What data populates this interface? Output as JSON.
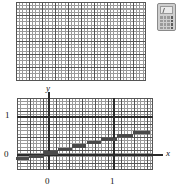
{
  "figure": {
    "top_panel": {
      "name": "blank-grid",
      "cols": 10,
      "rows": 6,
      "minor_per_major": 4
    },
    "calculator_icon": {
      "label": "calculator-icon",
      "rows": 4,
      "cols": 4
    },
    "plot": {
      "axis_x_name": "x",
      "axis_y_name": "y",
      "x_ticks": [
        "0",
        "1"
      ],
      "y_ticks": [
        "0",
        "1"
      ]
    }
  },
  "chart_data": {
    "type": "line",
    "title": "",
    "xlabel": "x",
    "ylabel": "y",
    "xlim": [
      -0.5,
      1.75
    ],
    "ylim": [
      -0.45,
      1.45
    ],
    "x_tick_values": [
      0,
      1
    ],
    "x_tick_labels": [
      "0",
      "1"
    ],
    "y_tick_values": [
      0,
      1
    ],
    "y_tick_labels": [
      "0",
      "1"
    ],
    "grid": true,
    "legend": "none",
    "annotation": "increasing step function (staircase), 6 horizontal segments",
    "series": [
      {
        "name": "step-function",
        "style": "step",
        "color": "#4a4a4a",
        "segments": [
          {
            "x_start": -0.5,
            "x_end": -0.3,
            "y": -0.1
          },
          {
            "x_start": -0.3,
            "x_end": -0.08,
            "y": -0.05
          },
          {
            "x_start": -0.08,
            "x_end": 0.14,
            "y": 0.05
          },
          {
            "x_start": 0.14,
            "x_end": 0.36,
            "y": 0.14
          },
          {
            "x_start": 0.36,
            "x_end": 0.58,
            "y": 0.23
          },
          {
            "x_start": 0.58,
            "x_end": 0.8,
            "y": 0.32
          },
          {
            "x_start": 0.8,
            "x_end": 1.05,
            "y": 0.41
          },
          {
            "x_start": 1.05,
            "x_end": 1.3,
            "y": 0.5
          },
          {
            "x_start": 1.3,
            "x_end": 1.55,
            "y": 0.59
          }
        ]
      }
    ]
  }
}
